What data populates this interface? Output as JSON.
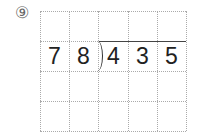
{
  "problem": {
    "number_label": "⑨",
    "divisor": [
      "7",
      "8"
    ],
    "dividend": [
      "4",
      "3",
      "5"
    ]
  },
  "grid": {
    "columns": 5,
    "rows": 4
  }
}
